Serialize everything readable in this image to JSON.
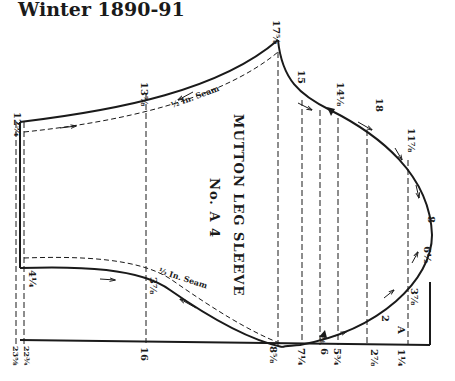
{
  "header": {
    "title": "Winter 1890-91"
  },
  "pattern": {
    "name": "MUTTON LEG SLEEVE",
    "number": "No. A 4",
    "seam_label": "½ In. Seam",
    "letter_mark": "A",
    "top_labels": {
      "left_corner": "12¾",
      "seam_top": "13⅞",
      "peak": "17⅝",
      "p15": "15",
      "p14": "14⅛",
      "p18": "18",
      "p11": "11⅞",
      "p8": "8",
      "p6": "6½",
      "p3": "3⅞",
      "p2": "2",
      "p4": "4¼",
      "p3b": "3⅞"
    },
    "bottom_labels": {
      "b1": "23⅝",
      "b2": "22¾",
      "b3": "16",
      "b4": "8⅝",
      "b5": "7¼",
      "b6": "6",
      "b7": "5¾",
      "b8": "2⅞",
      "b9": "1¼",
      "notch": "⅝"
    }
  }
}
